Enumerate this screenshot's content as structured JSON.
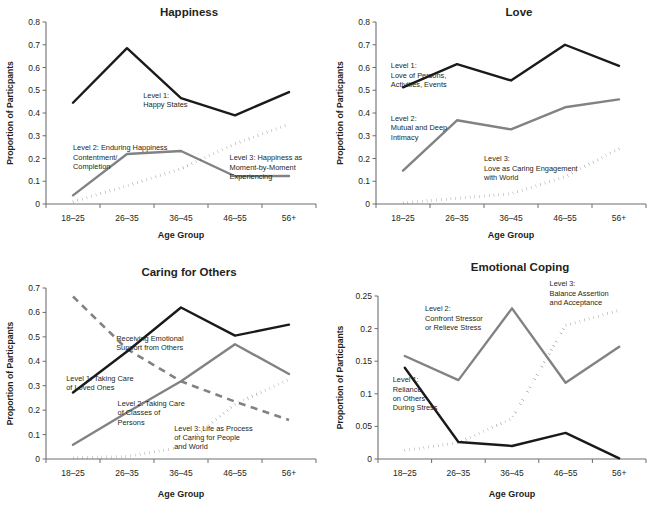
{
  "figure": {
    "categories": [
      "18–25",
      "26–35",
      "36–45",
      "46–55",
      "56+"
    ],
    "xlabel": "Age Group",
    "ylabel": "Proportion of  Particpants"
  },
  "colors": {
    "level1": "#1a1a1a",
    "level2": "#808285",
    "level3": "#1a1a1a",
    "axis": "#6d6e71",
    "text": "#231f20"
  },
  "chart_data": [
    {
      "type": "line",
      "title": "Happiness",
      "xlabel": "Age Group",
      "ylabel": "Proportion of  Particpants",
      "categories": [
        "18–25",
        "26–35",
        "36–45",
        "46–55",
        "56+"
      ],
      "ylim": [
        0,
        0.8
      ],
      "yticks": [
        0,
        0.1,
        0.2,
        0.3,
        0.4,
        0.5,
        0.6,
        0.7,
        0.8
      ],
      "ytick_labels": [
        "0",
        "0.1",
        "0.2",
        "0.3",
        "0.4",
        "0.5",
        "0.6",
        "0.7",
        "0.8"
      ],
      "grid": false,
      "legend": "annotations",
      "series": [
        {
          "name": "Level 1: Happy States",
          "style": "solid-black",
          "values": [
            0.445,
            0.685,
            0.465,
            0.39,
            0.492
          ]
        },
        {
          "name": "Level 2: Enduring Happiness Contentment/ Completion",
          "style": "solid-gray",
          "values": [
            0.038,
            0.22,
            0.233,
            0.122,
            0.123
          ]
        },
        {
          "name": "Level 3: Happiness as Moment-by-Moment Experiencing",
          "style": "dotted-black",
          "values": [
            0.01,
            0.08,
            0.155,
            0.265,
            0.35
          ]
        }
      ],
      "annotations": [
        {
          "text_lines": [
            "Level 1:",
            "Happy States"
          ],
          "x": 0.36,
          "y": 0.585
        },
        {
          "text_lines": [
            "Level 2:  Enduring Happiness",
            "Contentment/",
            "Completion"
          ],
          "x": 0.1,
          "y": 0.295
        },
        {
          "text_lines": [
            "Level 3: Happiness as",
            "Moment-by-Moment",
            "Experiencing"
          ],
          "x": 0.68,
          "y": 0.24
        }
      ]
    },
    {
      "type": "line",
      "title": "Love",
      "xlabel": "Age Group",
      "ylabel": "Proportion of  Particpants",
      "categories": [
        "18–25",
        "26–35",
        "36–45",
        "46–55",
        "56+"
      ],
      "ylim": [
        0,
        0.8
      ],
      "yticks": [
        0,
        0.1,
        0.2,
        0.3,
        0.4,
        0.5,
        0.6,
        0.7,
        0.8
      ],
      "ytick_labels": [
        "0",
        "0.1",
        "0.2",
        "0.3",
        "0.4",
        "0.5",
        "0.6",
        "0.7",
        "0.8"
      ],
      "grid": false,
      "legend": "annotations",
      "series": [
        {
          "name": "Level 1: Love of Persons, Activities, Events",
          "style": "solid-black",
          "values": [
            0.513,
            0.615,
            0.543,
            0.7,
            0.607
          ]
        },
        {
          "name": "Level 2: Mutual and Deep Intimacy",
          "style": "solid-gray",
          "values": [
            0.147,
            0.368,
            0.328,
            0.425,
            0.46
          ]
        },
        {
          "name": "Level 3: Love as Caring Engagement with World",
          "style": "dotted-black",
          "values": [
            0.005,
            0.025,
            0.045,
            0.12,
            0.243
          ]
        }
      ],
      "annotations": [
        {
          "text_lines": [
            "Level 1:",
            "Love of Persons,",
            "Activities, Events"
          ],
          "x": 0.055,
          "y": 0.745
        },
        {
          "text_lines": [
            "Level 2:",
            "Mutual and Deep",
            "Intimacy"
          ],
          "x": 0.055,
          "y": 0.455
        },
        {
          "text_lines": [
            "Level 3:",
            "Love as Caring Engagement",
            "with World"
          ],
          "x": 0.4,
          "y": 0.235
        }
      ]
    },
    {
      "type": "line",
      "title": "Caring for Others",
      "xlabel": "Age Group",
      "ylabel": "Proportion of  Particpants",
      "categories": [
        "18–25",
        "26–35",
        "36–45",
        "46–55",
        "56+"
      ],
      "ylim": [
        0,
        0.7
      ],
      "yticks": [
        0,
        0.1,
        0.2,
        0.3,
        0.4,
        0.5,
        0.6,
        0.7
      ],
      "ytick_labels": [
        "0",
        "0.1",
        "0.2",
        "0.3",
        "0.4",
        "0.5",
        "0.6",
        "0.7"
      ],
      "grid": false,
      "legend": "annotations",
      "series": [
        {
          "name": "Level 1: Taking Care of Loved Ones",
          "style": "solid-black",
          "values": [
            0.272,
            0.44,
            0.62,
            0.505,
            0.55
          ]
        },
        {
          "name": "Level 2: Taking Care of Classes of Persons",
          "style": "solid-gray",
          "values": [
            0.058,
            0.19,
            0.318,
            0.47,
            0.348
          ]
        },
        {
          "name": "Level 3: Life as Process of Caring for People and World",
          "style": "dotted-black",
          "values": [
            0.005,
            0.01,
            0.048,
            0.225,
            0.325
          ]
        },
        {
          "name": "Receiving Emotional Support from Others",
          "style": "dashed-gray",
          "values": [
            0.665,
            0.45,
            0.318,
            0.235,
            0.16
          ]
        }
      ],
      "annotations": [
        {
          "text_lines": [
            "Receiving Emotional",
            "Support from Others"
          ],
          "x": 0.26,
          "y": 0.69
        },
        {
          "text_lines": [
            "Level 1: Taking Care",
            "of Loved Ones"
          ],
          "x": 0.075,
          "y": 0.455
        },
        {
          "text_lines": [
            "Level 2: Taking Care",
            "of Classes of",
            "Persons"
          ],
          "x": 0.265,
          "y": 0.31
        },
        {
          "text_lines": [
            "Level 3: Life as Process",
            "of Caring for People",
            "and World"
          ],
          "x": 0.475,
          "y": 0.165
        }
      ]
    },
    {
      "type": "line",
      "title": "Emotional Coping",
      "xlabel": "Age Group",
      "ylabel": "Proportion of  Particpants",
      "categories": [
        "18–25",
        "26–35",
        "36–45",
        "46–55",
        "56+"
      ],
      "ylim": [
        0,
        0.25
      ],
      "yticks": [
        0,
        0.05,
        0.1,
        0.15,
        0.2,
        0.25
      ],
      "ytick_labels": [
        "0",
        "0.05",
        "0.1",
        "0.15",
        "0.2",
        "0.25"
      ],
      "grid": false,
      "legend": "annotations",
      "series": [
        {
          "name": "Level 1: Reliance on Others During Stress",
          "style": "solid-black",
          "values": [
            0.14,
            0.026,
            0.02,
            0.04,
            0.001
          ]
        },
        {
          "name": "Level 2: Confront Stressor or Relieve Stress",
          "style": "solid-gray",
          "values": [
            0.158,
            0.121,
            0.231,
            0.117,
            0.172
          ]
        },
        {
          "name": "Level 3: Balance Assertion and Acceptance",
          "style": "dotted-black",
          "values": [
            0.013,
            0.025,
            0.062,
            0.205,
            0.228
          ]
        }
      ],
      "annotations": [
        {
          "text_lines": [
            "Level 2:",
            "Confront Stressor",
            "or Relieve Stress"
          ],
          "x": 0.175,
          "y": 0.905
        },
        {
          "text_lines": [
            "Level 3:",
            "Balance Assertion",
            "and Acceptance"
          ],
          "x": 0.64,
          "y": 1.06
        },
        {
          "text_lines": [
            "Level 1:",
            "Reliance",
            "on Others",
            "During Stress"
          ],
          "x": 0.055,
          "y": 0.47
        }
      ]
    }
  ]
}
